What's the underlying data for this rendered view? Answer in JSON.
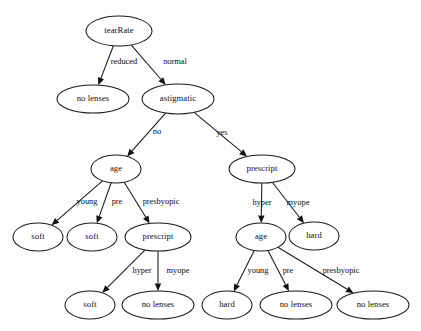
{
  "diagram": {
    "type": "decision-tree",
    "width": 421,
    "height": 331,
    "background_color": "#fdfdfd",
    "stroke_color": "#1a1a1a",
    "text_color": "#0d0d0d",
    "node_fill": "#ffffff"
  },
  "nodes": [
    {
      "id": "n0",
      "label": "tearRate",
      "kind": "decision",
      "cx": 119,
      "cy": 31,
      "rx": 33,
      "ry": 15
    },
    {
      "id": "n1",
      "label": "no lenses",
      "kind": "leaf",
      "cx": 93,
      "cy": 99,
      "rx": 36,
      "ry": 14
    },
    {
      "id": "n2",
      "label": "astigmatic",
      "kind": "decision",
      "cx": 178,
      "cy": 99,
      "rx": 36,
      "ry": 15
    },
    {
      "id": "n3",
      "label": "age",
      "kind": "decision",
      "cx": 116,
      "cy": 169,
      "rx": 25,
      "ry": 14
    },
    {
      "id": "n4",
      "label": "prescript",
      "kind": "decision",
      "cx": 262,
      "cy": 169,
      "rx": 33,
      "ry": 14
    },
    {
      "id": "n5",
      "label": "soft",
      "kind": "leaf",
      "cx": 38,
      "cy": 237,
      "rx": 25,
      "ry": 14
    },
    {
      "id": "n6",
      "label": "soft",
      "kind": "leaf",
      "cx": 92,
      "cy": 237,
      "rx": 25,
      "ry": 14
    },
    {
      "id": "n7",
      "label": "prescript",
      "kind": "decision",
      "cx": 158,
      "cy": 237,
      "rx": 33,
      "ry": 14
    },
    {
      "id": "n8",
      "label": "age",
      "kind": "decision",
      "cx": 261,
      "cy": 237,
      "rx": 25,
      "ry": 14
    },
    {
      "id": "n9",
      "label": "hard",
      "kind": "leaf",
      "cx": 314,
      "cy": 236,
      "rx": 25,
      "ry": 14
    },
    {
      "id": "n10",
      "label": "soft",
      "kind": "leaf",
      "cx": 90,
      "cy": 305,
      "rx": 25,
      "ry": 14
    },
    {
      "id": "n11",
      "label": "no lenses",
      "kind": "leaf",
      "cx": 158,
      "cy": 305,
      "rx": 36,
      "ry": 14
    },
    {
      "id": "n12",
      "label": "hard",
      "kind": "leaf",
      "cx": 227,
      "cy": 305,
      "rx": 25,
      "ry": 14
    },
    {
      "id": "n13",
      "label": "no lenses",
      "kind": "leaf",
      "cx": 296,
      "cy": 305,
      "rx": 36,
      "ry": 14
    },
    {
      "id": "n14",
      "label": "no lenses",
      "kind": "leaf",
      "cx": 373,
      "cy": 305,
      "rx": 36,
      "ry": 14
    }
  ],
  "edges": [
    {
      "from": "n0",
      "to": "n1",
      "label": "reduced",
      "lx": 124,
      "ly": 62
    },
    {
      "from": "n0",
      "to": "n2",
      "label": "normal",
      "lx": 175,
      "ly": 62
    },
    {
      "from": "n2",
      "to": "n3",
      "label": "no",
      "lx": 157,
      "ly": 132
    },
    {
      "from": "n2",
      "to": "n4",
      "label": "yes",
      "lx": 222,
      "ly": 133
    },
    {
      "from": "n3",
      "to": "n5",
      "label": "young",
      "lx": 87,
      "ly": 202
    },
    {
      "from": "n3",
      "to": "n6",
      "label": "pre",
      "lx": 117,
      "ly": 202
    },
    {
      "from": "n3",
      "to": "n7",
      "label": "presbyopic",
      "lx": 161,
      "ly": 202
    },
    {
      "from": "n4",
      "to": "n8",
      "label": "hyper",
      "lx": 262,
      "ly": 203
    },
    {
      "from": "n4",
      "to": "n9",
      "label": "myope",
      "lx": 298,
      "ly": 203
    },
    {
      "from": "n7",
      "to": "n10",
      "label": "hyper",
      "lx": 142,
      "ly": 271
    },
    {
      "from": "n7",
      "to": "n11",
      "label": "myope",
      "lx": 178,
      "ly": 271
    },
    {
      "from": "n8",
      "to": "n12",
      "label": "young",
      "lx": 258,
      "ly": 271
    },
    {
      "from": "n8",
      "to": "n13",
      "label": "pre",
      "lx": 288,
      "ly": 271
    },
    {
      "from": "n8",
      "to": "n14",
      "label": "presbyopic",
      "lx": 341,
      "ly": 271
    }
  ]
}
